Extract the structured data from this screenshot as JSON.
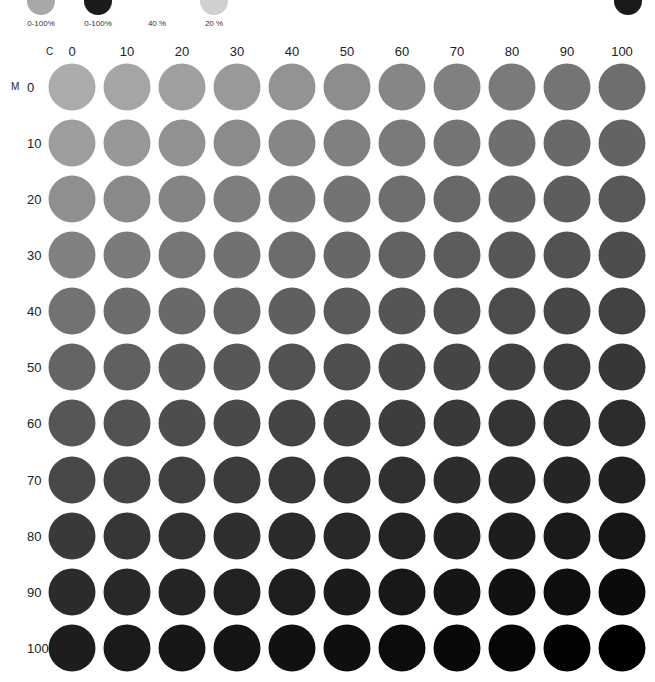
{
  "legend": {
    "items": [
      {
        "label": "0-100%",
        "x": 41,
        "color": "#a8a8a8",
        "dot": true
      },
      {
        "label": "0-100%",
        "x": 98,
        "color": "#1b1b1b",
        "dot": true
      },
      {
        "label": "40 %",
        "x": 157,
        "color": "#ffffff",
        "dot": false
      },
      {
        "label": "20 %",
        "x": 214,
        "color": "#d0d0d0",
        "dot": true
      }
    ],
    "corner_dot": {
      "x": 628,
      "color": "#1a1a1a"
    }
  },
  "axes": {
    "c_label": "C",
    "m_label": "M"
  },
  "columns": [
    "0",
    "10",
    "20",
    "30",
    "40",
    "50",
    "60",
    "70",
    "80",
    "90",
    "100"
  ],
  "rows": [
    "0",
    "10",
    "20",
    "30",
    "40",
    "50",
    "60",
    "70",
    "80",
    "90",
    "100"
  ],
  "grid": {
    "col_x": [
      72,
      127,
      182,
      237,
      292,
      347,
      402,
      457,
      512,
      567,
      622
    ],
    "row_y": [
      87,
      143,
      199,
      255,
      311,
      367,
      423,
      480,
      536,
      592,
      648
    ],
    "corner_colors": {
      "c0m0": 171,
      "c100m0": 110,
      "c0m100": 29,
      "c100m100": 0
    }
  }
}
